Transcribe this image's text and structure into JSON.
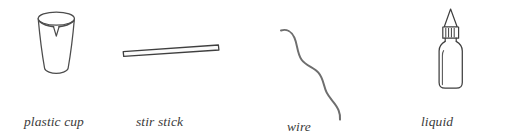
{
  "figure": {
    "width": 516,
    "height": 139,
    "background_color": "#ffffff",
    "ink_color": "#555555",
    "text_color": "#3b3b3b",
    "style": "line-drawing materials illustration"
  },
  "items": [
    {
      "id": "plastic-cup",
      "icon": "plastic-cup-with-notch-icon",
      "caption_lines": [
        "plastic cup",
        "with notch"
      ]
    },
    {
      "id": "stir-stick",
      "icon": "stir-stick-icon",
      "caption_lines": [
        "stir stick"
      ]
    },
    {
      "id": "wire",
      "icon": "wire-icon",
      "caption_lines": [
        "wire"
      ]
    },
    {
      "id": "liquid-detergent",
      "icon": "liquid-detergent-bottle-icon",
      "caption_lines": [
        "liquid",
        "detergent"
      ]
    }
  ]
}
